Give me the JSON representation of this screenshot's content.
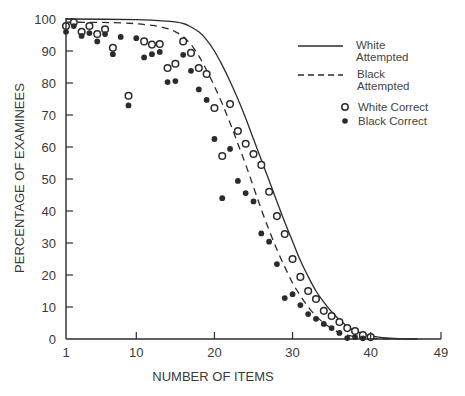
{
  "chart_data": {
    "type": "line",
    "title": "",
    "xlabel": "NUMBER OF ITEMS",
    "ylabel": "PERCENTAGE OF EXAMINEES",
    "xlim": [
      1,
      49
    ],
    "ylim": [
      0,
      100
    ],
    "x_ticks": [
      1,
      10,
      20,
      30,
      40,
      49
    ],
    "y_ticks": [
      0,
      10,
      20,
      30,
      40,
      50,
      60,
      70,
      80,
      90,
      100
    ],
    "grid": false,
    "legend_position": "upper right",
    "series": [
      {
        "name": "White Attempted",
        "legend_label": [
          "White",
          "Attempted"
        ],
        "style": "solid-line",
        "x": [
          1,
          10,
          14,
          16,
          17,
          18,
          19,
          20,
          21,
          22,
          23,
          24,
          25,
          26,
          27,
          28,
          29,
          30,
          31,
          32,
          33,
          34,
          35,
          36,
          37,
          38,
          39,
          40,
          41,
          42,
          43,
          44,
          45,
          46
        ],
        "values": [
          100,
          99.8,
          99.3,
          98.6,
          97.5,
          96,
          93.5,
          90,
          85.5,
          80.5,
          75,
          69,
          62.5,
          56,
          49.5,
          43,
          36.5,
          30.5,
          24.5,
          19.5,
          15,
          11.5,
          8.5,
          6,
          4,
          2.6,
          1.6,
          1,
          0.6,
          0.3,
          0.15,
          0.05,
          0,
          0
        ]
      },
      {
        "name": "Black Attempted",
        "legend_label": [
          "Black",
          "Attempted"
        ],
        "style": "dashed-line",
        "x": [
          1,
          8,
          12,
          14,
          15,
          16,
          17,
          18,
          19,
          20,
          21,
          22,
          23,
          24,
          25,
          26,
          27,
          28,
          29,
          30,
          31,
          32,
          33,
          34,
          35,
          36,
          37,
          38,
          39,
          40,
          41,
          42,
          43
        ],
        "values": [
          99,
          98.8,
          98,
          97,
          96,
          94.5,
          92,
          88.5,
          84,
          79,
          73.5,
          67.5,
          61,
          54.5,
          47.5,
          40.5,
          34,
          28,
          22.5,
          17.5,
          13.5,
          10,
          7.2,
          5,
          3.3,
          2,
          1.2,
          0.7,
          0.4,
          0.2,
          0.1,
          0.05,
          0
        ]
      },
      {
        "name": "White Correct",
        "style": "open-circle",
        "x": [
          1,
          2,
          3,
          4,
          5,
          6,
          7,
          9,
          11,
          12,
          13,
          14,
          15,
          16,
          17,
          18,
          19,
          20,
          21,
          22,
          23,
          24,
          25,
          26,
          27,
          28,
          29,
          30,
          31,
          32,
          33,
          34,
          35,
          36,
          37,
          38,
          39,
          40
        ],
        "values": [
          97.8,
          99,
          96,
          97.8,
          95.3,
          96.8,
          91,
          76,
          93,
          92,
          92.2,
          84.7,
          86,
          93,
          89.4,
          84.7,
          82.8,
          72.2,
          57.2,
          73.4,
          65,
          61,
          57.8,
          54.4,
          46,
          38.4,
          32.8,
          25,
          19.4,
          15,
          12.5,
          8.8,
          7.2,
          5.3,
          3.4,
          2.5,
          1.2,
          0.6
        ]
      },
      {
        "name": "Black Correct",
        "style": "filled-circle",
        "x": [
          1,
          2,
          3,
          4,
          5,
          6,
          7,
          8,
          9,
          10,
          11,
          12,
          13,
          14,
          15,
          16,
          17,
          18,
          19,
          20,
          21,
          22,
          23,
          24,
          25,
          26,
          27,
          28,
          29,
          30,
          31,
          32,
          33,
          34,
          35,
          36,
          37,
          38,
          39
        ],
        "values": [
          96,
          97.8,
          94.7,
          95.6,
          93,
          95.3,
          89,
          94.4,
          73,
          94,
          88,
          89,
          89.7,
          80.3,
          80.6,
          88.8,
          83.8,
          78,
          74.7,
          62.5,
          44,
          59.4,
          49.4,
          45.6,
          43,
          33,
          30.4,
          23.4,
          12.8,
          14,
          10.6,
          7.8,
          6.3,
          4.7,
          3.4,
          1.9,
          0.3,
          0.6,
          0.2
        ]
      }
    ],
    "legend": [
      {
        "label_line1": "White",
        "label_line2": "Attempted",
        "marker": "solid-line"
      },
      {
        "label_line1": "Black",
        "label_line2": "Attempted",
        "marker": "dashed-line"
      },
      {
        "label_line1": "White Correct",
        "marker": "open-circle"
      },
      {
        "label_line1": "Black Correct",
        "marker": "filled-circle"
      }
    ],
    "colors": {
      "ink": "#2b2b2b",
      "text": "#3a3a3a",
      "background": "#ffffff"
    }
  }
}
